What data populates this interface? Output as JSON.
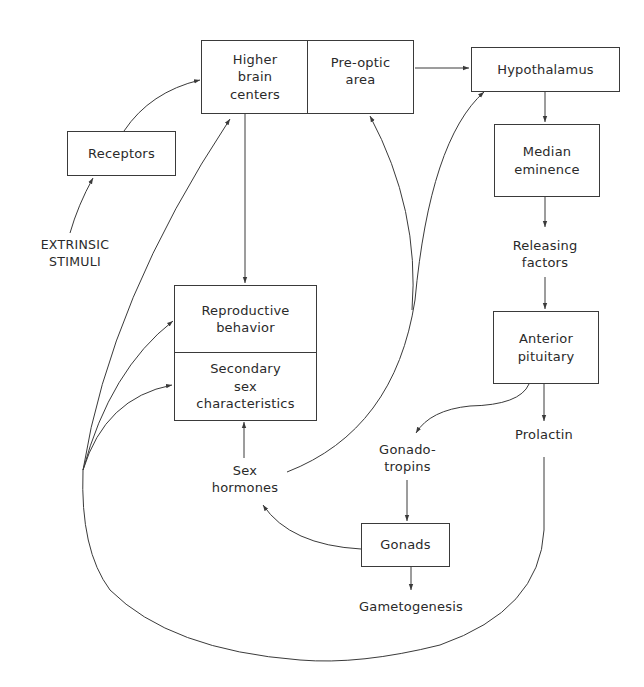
{
  "diagram": {
    "nodes": {
      "receptors": "Receptors",
      "extrinsic_stimuli": "EXTRINSIC\nSTIMULI",
      "higher_brain_centers": "Higher\nbrain\ncenters",
      "pre_optic_area": "Pre-optic\narea",
      "hypothalamus": "Hypothalamus",
      "median_eminence": "Median\neminence",
      "releasing_factors": "Releasing\nfactors",
      "anterior_pituitary": "Anterior\npituitary",
      "prolactin": "Prolactin",
      "gonadotropins": "Gonado-\ntropins",
      "gonads": "Gonads",
      "gametogenesis": "Gametogenesis",
      "sex_hormones": "Sex\nhormones",
      "reproductive_behavior": "Reproductive\nbehavior",
      "secondary_sex_characteristics": "Secondary\nsex\ncharacteristics"
    },
    "edges": [
      {
        "from": "EXTRINSIC STIMULI",
        "to": "Receptors"
      },
      {
        "from": "Receptors",
        "to": "Higher brain centers"
      },
      {
        "from": "Pre-optic area",
        "to": "Hypothalamus"
      },
      {
        "from": "Higher brain centers",
        "to": "Reproductive behavior"
      },
      {
        "from": "Hypothalamus",
        "to": "Median eminence"
      },
      {
        "from": "Median eminence",
        "to": "Releasing factors"
      },
      {
        "from": "Releasing factors",
        "to": "Anterior pituitary"
      },
      {
        "from": "Anterior pituitary",
        "to": "Gonadotropins"
      },
      {
        "from": "Anterior pituitary",
        "to": "Prolactin"
      },
      {
        "from": "Gonadotropins",
        "to": "Gonads"
      },
      {
        "from": "Gonads",
        "to": "Gametogenesis"
      },
      {
        "from": "Gonads",
        "to": "Sex hormones"
      },
      {
        "from": "Sex hormones",
        "to": "Secondary sex characteristics"
      },
      {
        "from": "Sex hormones",
        "to": "Hypothalamus"
      },
      {
        "from": "Sex hormones",
        "to": "Pre-optic area"
      },
      {
        "from": "Prolactin",
        "to": "Higher brain centers"
      },
      {
        "from": "Prolactin",
        "to": "Reproductive behavior"
      },
      {
        "from": "Prolactin",
        "to": "Secondary sex characteristics"
      }
    ],
    "line_color": "#3a3a3a"
  }
}
